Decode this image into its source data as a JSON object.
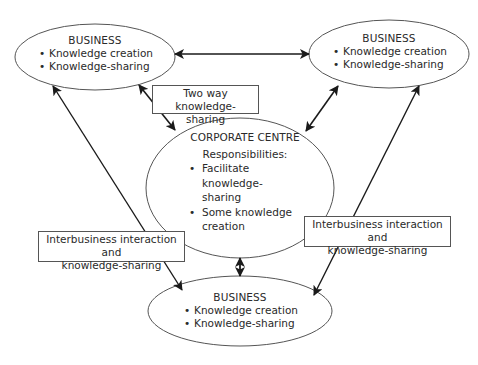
{
  "diagram": {
    "nodes": {
      "business_top_left": {
        "title": "BUSINESS",
        "bullets": [
          "Knowledge creation",
          "Knowledge-sharing"
        ]
      },
      "business_top_right": {
        "title": "BUSINESS",
        "bullets": [
          "Knowledge creation",
          "Knowledge-sharing"
        ]
      },
      "corporate_centre": {
        "title": "CORPORATE CENTRE",
        "subtitle": "Responsibilities:",
        "bullets": [
          "Facilitate knowledge-sharing",
          "Some knowledge creation"
        ],
        "bullet_lines": [
          [
            "Facilitate knowledge-",
            "sharing"
          ],
          [
            "Some knowledge",
            "creation"
          ]
        ]
      },
      "business_bottom": {
        "title": "BUSINESS",
        "bullets": [
          "Knowledge creation",
          "Knowledge-sharing"
        ]
      }
    },
    "labels": {
      "two_way": {
        "line1": "Two way knowledge-",
        "line2": "sharing"
      },
      "interbusiness_left": {
        "line1": "Interbusiness interaction and",
        "line2": "knowledge-sharing"
      },
      "interbusiness_right": {
        "line1": "Interbusiness interaction and",
        "line2": "knowledge-sharing"
      }
    },
    "edges": [
      {
        "from": "business_top_left",
        "to": "business_top_right",
        "direction": "both"
      },
      {
        "from": "business_top_left",
        "to": "corporate_centre",
        "direction": "both",
        "label": "two_way"
      },
      {
        "from": "business_top_right",
        "to": "corporate_centre",
        "direction": "both"
      },
      {
        "from": "corporate_centre",
        "to": "business_bottom",
        "direction": "both"
      },
      {
        "from": "business_top_left",
        "to": "business_bottom",
        "direction": "both",
        "label": "interbusiness_left"
      },
      {
        "from": "business_top_right",
        "to": "business_bottom",
        "direction": "both",
        "label": "interbusiness_right"
      }
    ],
    "colors": {
      "line": "#1a1a1a",
      "ellipse_stroke": "#555555",
      "text": "#2a2a2a",
      "background": "#ffffff"
    }
  }
}
